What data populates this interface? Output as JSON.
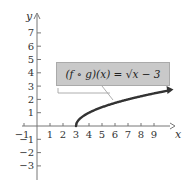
{
  "chart_data": {
    "type": "line",
    "title": "",
    "xlabel": "x",
    "ylabel": "y",
    "function": "(f ∘ g)(x) = √(x − 3)",
    "x": [
      3,
      4,
      5,
      6,
      7,
      8,
      9,
      10.5
    ],
    "values": [
      0,
      1,
      1.414,
      1.732,
      2,
      2.236,
      2.449,
      2.739
    ],
    "xlim": [
      -1.5,
      10.5
    ],
    "ylim": [
      -4,
      8.5
    ],
    "x_ticks": [
      -1,
      1,
      2,
      3,
      4,
      5,
      6,
      7,
      8,
      9
    ],
    "y_ticks": [
      -3,
      -2,
      -1,
      1,
      2,
      3,
      4,
      5,
      6,
      7
    ],
    "grid": false,
    "legend": "none",
    "annotation": "(f ∘ g)(x) = √x − 3"
  },
  "labels": {
    "x_axis": "x",
    "y_axis": "y",
    "callout": "(f ∘ g)(x) = √x − 3"
  },
  "colors": {
    "curve": "#333333",
    "axis": "#777777",
    "callout_bg": "#c9c9c9"
  }
}
